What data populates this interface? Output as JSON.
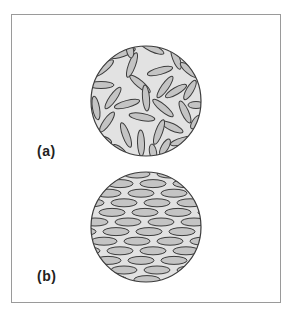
{
  "figure": {
    "panels": [
      {
        "id": "a",
        "label": "(a)",
        "description": "random orientation of ellipses within circle",
        "circle": {
          "cx": 146,
          "cy": 101,
          "r": 55
        }
      },
      {
        "id": "b",
        "label": "(b)",
        "description": "aligned horizontal ellipses within circle",
        "circle": {
          "cx": 146,
          "cy": 227,
          "r": 55
        }
      }
    ]
  },
  "colors": {
    "frame": "#9a9a9a",
    "circle_fill": "#e2e2e2",
    "ellipse_fill": "#c4c4c4",
    "stroke": "#3c3c3c",
    "label": "#222222"
  },
  "ellipses_a": [
    [
      123,
      53,
      13,
      3.5,
      -20
    ],
    [
      152,
      48,
      13,
      3.5,
      25
    ],
    [
      176,
      58,
      12,
      3.5,
      70
    ],
    [
      189,
      70,
      11,
      3.5,
      40
    ],
    [
      104,
      68,
      12,
      3.5,
      -40
    ],
    [
      132,
      65,
      13,
      3.5,
      -70
    ],
    [
      160,
      71,
      13,
      3.5,
      -15
    ],
    [
      140,
      84,
      13,
      3.5,
      40
    ],
    [
      165,
      87,
      13,
      3.5,
      -55
    ],
    [
      190,
      90,
      11,
      3.5,
      -60
    ],
    [
      101,
      85,
      13,
      3.5,
      0
    ],
    [
      113,
      98,
      13,
      3.5,
      -55
    ],
    [
      146,
      98,
      13,
      3.5,
      85
    ],
    [
      176,
      91,
      12,
      3.5,
      -30
    ],
    [
      96,
      108,
      12,
      3.5,
      80
    ],
    [
      127,
      104,
      13,
      3.5,
      -15
    ],
    [
      163,
      108,
      13,
      3.5,
      40
    ],
    [
      185,
      112,
      12,
      3.5,
      65
    ],
    [
      196,
      105,
      8,
      3.5,
      0
    ],
    [
      107,
      122,
      12,
      3.5,
      -55
    ],
    [
      142,
      117,
      13,
      3.5,
      10
    ],
    [
      172,
      127,
      12,
      3.5,
      25
    ],
    [
      196,
      122,
      8,
      3.5,
      -55
    ],
    [
      126,
      135,
      13,
      3.5,
      70
    ],
    [
      159,
      132,
      13,
      3.5,
      -70
    ],
    [
      183,
      141,
      13,
      3.5,
      -15
    ],
    [
      141,
      143,
      13,
      3.5,
      88
    ],
    [
      104,
      140,
      8,
      3.5,
      20
    ],
    [
      120,
      151,
      9,
      3.5,
      40
    ],
    [
      153,
      152,
      8,
      3.5,
      80
    ],
    [
      165,
      147,
      9,
      3.5,
      -60
    ],
    [
      130,
      50,
      8,
      3.5,
      80
    ]
  ],
  "ellipses_b": {
    "rx": 13,
    "ry": 4,
    "row_start_y": 174,
    "row_spacing": 9.6,
    "col_spacing": 33,
    "rows": 12,
    "offsets": [
      0,
      16,
      4,
      20,
      8,
      24,
      12,
      0,
      16,
      4,
      20,
      10
    ]
  }
}
